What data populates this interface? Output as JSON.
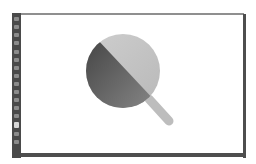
{
  "app": {
    "type": "image-editor",
    "toolbar": {
      "tools": [
        {
          "icon": "move-tool-icon",
          "active": false
        },
        {
          "icon": "marquee-tool-icon",
          "active": false
        },
        {
          "icon": "lasso-tool-icon",
          "active": false
        },
        {
          "icon": "magic-wand-tool-icon",
          "active": false
        },
        {
          "icon": "crop-tool-icon",
          "active": false
        },
        {
          "icon": "eyedropper-tool-icon",
          "active": false
        },
        {
          "icon": "brush-tool-icon",
          "active": false
        },
        {
          "icon": "stamp-tool-icon",
          "active": false
        },
        {
          "icon": "eraser-tool-icon",
          "active": false
        },
        {
          "icon": "gradient-tool-icon",
          "active": false
        },
        {
          "icon": "dodge-tool-icon",
          "active": false
        },
        {
          "icon": "pen-tool-icon",
          "active": false
        },
        {
          "icon": "type-tool-icon",
          "active": false
        },
        {
          "icon": "shape-tool-icon",
          "active": true
        },
        {
          "icon": "hand-tool-icon",
          "active": false
        },
        {
          "icon": "zoom-tool-icon",
          "active": false
        }
      ]
    },
    "canvas": {
      "artwork": "magnifying-glass",
      "colors": {
        "lens_light": "#c4c4c4",
        "lens_dark": "#5a5a5a",
        "handle": "#bdbdbd",
        "background": "#ffffff"
      }
    },
    "colors": {
      "toolbar": "#4a4a4a",
      "frame": "#4e4e4e",
      "top_border": "#8f8f8f"
    }
  }
}
